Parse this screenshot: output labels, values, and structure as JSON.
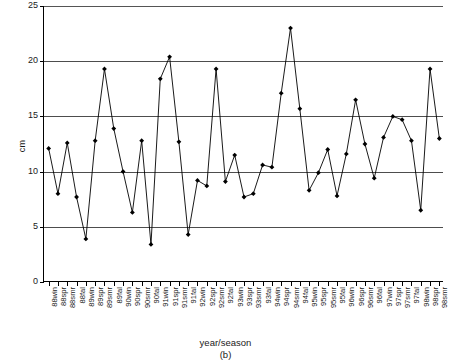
{
  "chart_data": {
    "type": "line",
    "title": "",
    "subtitle": "",
    "xlabel": "year/season",
    "ylabel": "cm",
    "caption": "(b)",
    "ylim": [
      0,
      25
    ],
    "yticks": [
      0,
      5,
      10,
      15,
      20,
      25
    ],
    "ytick_labels": [
      "0",
      "5",
      "10",
      "15",
      "20",
      "25"
    ],
    "grid": "horizontal",
    "legend": "none",
    "marker": "diamond",
    "line_color": "#000000",
    "grid_color": "#4d4d4d",
    "axis_color": "#000000",
    "categories": [
      "88win",
      "88spr",
      "88smr",
      "88fal",
      "89win",
      "89spr",
      "89smr",
      "89fal",
      "90win",
      "90spr",
      "90smr",
      "90fal",
      "91win",
      "91spr",
      "91smr",
      "91fal",
      "92win",
      "92spr",
      "92smr",
      "92fal",
      "93win",
      "93spr",
      "93smr",
      "93fal",
      "94win",
      "94spr",
      "94smr",
      "94fal",
      "95win",
      "95spr",
      "95smr",
      "95fal",
      "96win",
      "96spr",
      "96smr",
      "96fal",
      "97win",
      "97spr",
      "97smr",
      "97fal",
      "98win",
      "98spr",
      "98smr"
    ],
    "values": [
      12.1,
      8.0,
      12.6,
      7.7,
      3.9,
      12.8,
      19.3,
      13.9,
      10.0,
      6.3,
      12.8,
      3.4,
      18.4,
      20.4,
      12.7,
      4.3,
      9.2,
      8.7,
      19.3,
      9.1,
      11.5,
      7.7,
      8.0,
      10.6,
      10.4,
      17.1,
      23.0,
      15.7,
      8.3,
      9.9,
      12.0,
      7.8,
      11.6,
      16.5,
      12.5,
      9.4,
      13.1,
      15.0,
      14.7,
      12.8,
      6.5,
      19.3,
      13.0
    ]
  }
}
